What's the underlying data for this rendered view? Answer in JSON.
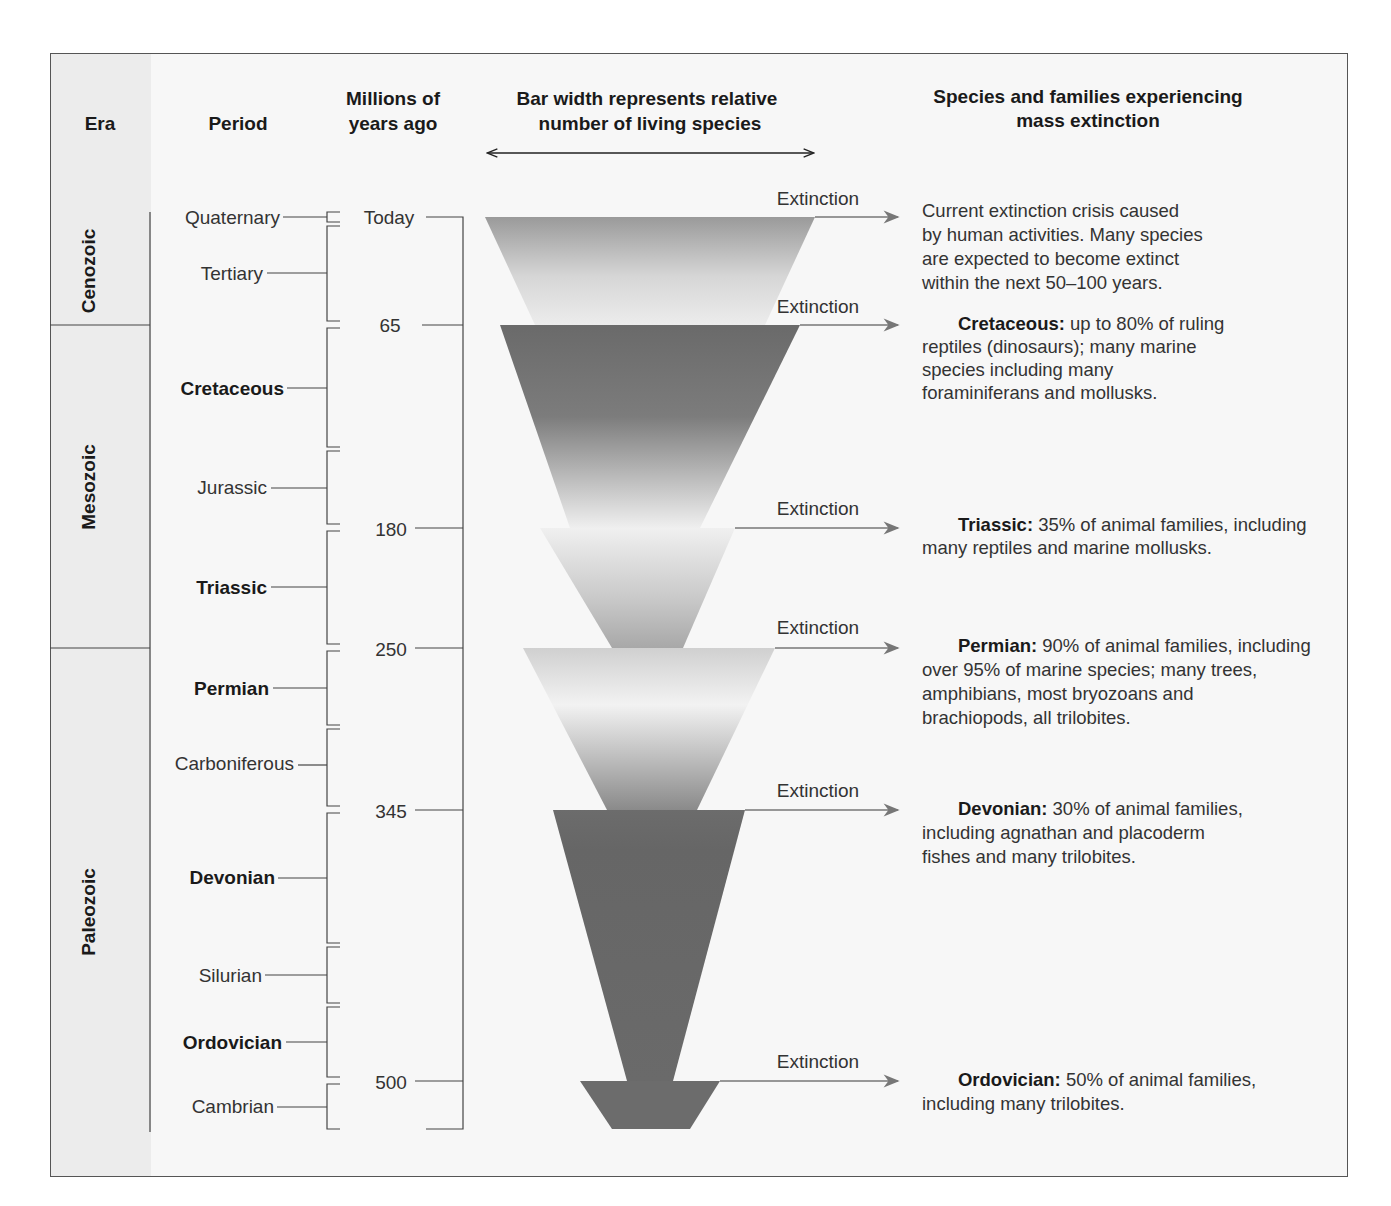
{
  "headers": {
    "era": "Era",
    "period": "Period",
    "mya_line1": "Millions of",
    "mya_line2": "years ago",
    "bar_line1": "Bar width represents relative",
    "bar_line2": "number of living species",
    "species_line1": "Species and families experiencing",
    "species_line2": "mass extinction"
  },
  "eras": [
    {
      "name": "Cenozoic"
    },
    {
      "name": "Mesozoic"
    },
    {
      "name": "Paleozoic"
    }
  ],
  "periods": [
    {
      "name": "Quaternary",
      "bold": false
    },
    {
      "name": "Tertiary",
      "bold": false
    },
    {
      "name": "Cretaceous",
      "bold": true
    },
    {
      "name": "Jurassic",
      "bold": false
    },
    {
      "name": "Triassic",
      "bold": true
    },
    {
      "name": "Permian",
      "bold": true
    },
    {
      "name": "Carboniferous",
      "bold": false
    },
    {
      "name": "Devonian",
      "bold": true
    },
    {
      "name": "Silurian",
      "bold": false
    },
    {
      "name": "Ordovician",
      "bold": true
    },
    {
      "name": "Cambrian",
      "bold": false
    }
  ],
  "time_marks": [
    "Today",
    "65",
    "180",
    "250",
    "345",
    "500"
  ],
  "extinction_label": "Extinction",
  "extinctions": [
    {
      "title": "",
      "lines": [
        "Current extinction crisis caused",
        "by human activities. Many species",
        "are expected to become extinct",
        "within the next 50–100 years."
      ]
    },
    {
      "title": "Cretaceous:",
      "lines": [
        " up to 80% of ruling",
        "reptiles (dinosaurs); many marine",
        "species including many",
        "foraminiferans and mollusks."
      ]
    },
    {
      "title": "Triassic:",
      "lines": [
        " 35% of animal families, including",
        "many reptiles and marine mollusks."
      ]
    },
    {
      "title": "Permian:",
      "lines": [
        " 90% of animal families, including",
        "over 95% of marine species; many trees,",
        "amphibians, most bryozoans and",
        "brachiopods, all trilobites."
      ]
    },
    {
      "title": "Devonian:",
      "lines": [
        " 30% of animal families,",
        "including agnathan and placoderm",
        "fishes and many trilobites."
      ]
    },
    {
      "title": "Ordovician:",
      "lines": [
        " 50% of animal families,",
        "including many trilobites."
      ]
    }
  ],
  "colors": {
    "dark": "#6e6e6e",
    "light": "#f2f2f2",
    "frame_bg": "#f7f7f7",
    "era_band": "#ececec"
  }
}
